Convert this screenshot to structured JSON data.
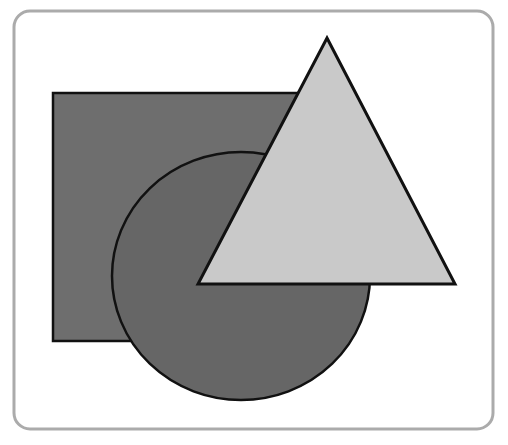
{
  "figure": {
    "frame": {
      "x": 14,
      "y": 11,
      "width": 479,
      "height": 418,
      "radius": 16,
      "stroke": "#ababab",
      "fill": "#ffffff"
    },
    "shapes": [
      {
        "kind": "rectangle",
        "x": 53,
        "y": 93,
        "width": 260,
        "height": 248,
        "fill": "#6e6e6e",
        "stroke": "#111111"
      },
      {
        "kind": "circle",
        "cx": 241,
        "cy": 276,
        "rx": 129,
        "ry": 124,
        "fill": "#666666",
        "stroke": "#111111"
      },
      {
        "kind": "triangle",
        "points": "327,38 455,284 198,284",
        "fill": "#c9c9c9",
        "stroke": "#111111"
      }
    ]
  }
}
